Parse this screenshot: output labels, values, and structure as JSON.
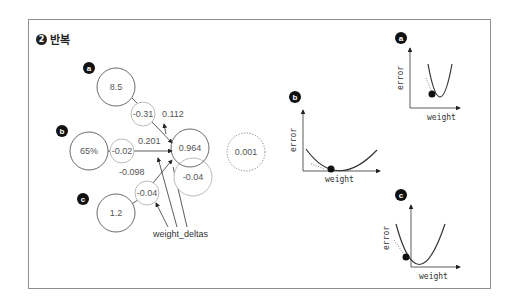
{
  "title": {
    "number": "2",
    "label": "반복"
  },
  "nodes": {
    "a": {
      "badge": "a",
      "input": "8.5",
      "weight_delta": "-0.31",
      "weight_delta_val": "0.112"
    },
    "b": {
      "badge": "b",
      "input": "65%",
      "weight_delta": "-0.02",
      "weight_delta_val": "0.201"
    },
    "c": {
      "badge": "c",
      "input": "1.2",
      "weight_delta": "-0.04",
      "weight_delta_val": "-0.098"
    },
    "output": {
      "prediction": "0.964",
      "delta": "-0.04",
      "error": "0.001"
    }
  },
  "label_weight_deltas": "weight_deltas",
  "plots": {
    "a": {
      "badge": "a",
      "ylabel": "error",
      "xlabel": "weight"
    },
    "b": {
      "badge": "b",
      "ylabel": "error",
      "xlabel": "weight"
    },
    "c": {
      "badge": "c",
      "ylabel": "error",
      "xlabel": "weight"
    }
  }
}
